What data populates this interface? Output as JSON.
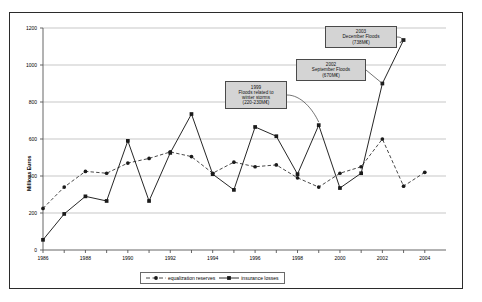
{
  "chart_data": {
    "type": "line",
    "title": "",
    "xlabel": "",
    "ylabel": "Millions Euros",
    "x": [
      1986,
      1987,
      1988,
      1989,
      1990,
      1991,
      1992,
      1993,
      1994,
      1995,
      1996,
      1997,
      1998,
      1999,
      2000,
      2001,
      2002,
      2003,
      2004
    ],
    "xlim": [
      1986,
      2005
    ],
    "ylim": [
      0,
      1200
    ],
    "yticks": [
      0,
      200,
      400,
      600,
      800,
      1000,
      1200
    ],
    "xticks": [
      1986,
      1988,
      1990,
      1992,
      1994,
      1996,
      1998,
      2000,
      2002,
      2004
    ],
    "grid": "horizontal",
    "legend_position": "bottom",
    "series": [
      {
        "name": "equalization reserves",
        "style": "dashed",
        "marker": "circle",
        "values": [
          225,
          340,
          425,
          415,
          470,
          495,
          530,
          505,
          415,
          475,
          450,
          460,
          390,
          340,
          415,
          450,
          600,
          345,
          420
        ]
      },
      {
        "name": "insurance losses",
        "style": "solid",
        "marker": "square",
        "values": [
          55,
          195,
          290,
          265,
          590,
          265,
          525,
          735,
          410,
          325,
          665,
          615,
          410,
          675,
          335,
          415,
          900,
          1135,
          null
        ]
      }
    ],
    "annotations": [
      {
        "id": "annotation-1999",
        "lines": [
          "1999",
          "Floods related to",
          "winter storms",
          "(220-230M€)"
        ],
        "target_year": 1999,
        "target_value": 675
      },
      {
        "id": "annotation-2002",
        "lines": [
          "2002",
          "September Floods",
          "(670M€)"
        ],
        "target_year": 2002,
        "target_value": 900
      },
      {
        "id": "annotation-2003",
        "lines": [
          "2003",
          "December Floods",
          "(738M€)"
        ],
        "target_year": 2003,
        "target_value": 1135
      }
    ]
  },
  "legend": {
    "items": [
      {
        "label": "equalization reserves"
      },
      {
        "label": "insurance losses"
      }
    ]
  },
  "colors": {
    "frame": "#2b2b2b",
    "grid": "#b0b0b0",
    "line": "#1a1a1a",
    "annotation_bg": "#d4d4d4",
    "annotation_border": "#4a4a4a",
    "text": "#000000"
  }
}
